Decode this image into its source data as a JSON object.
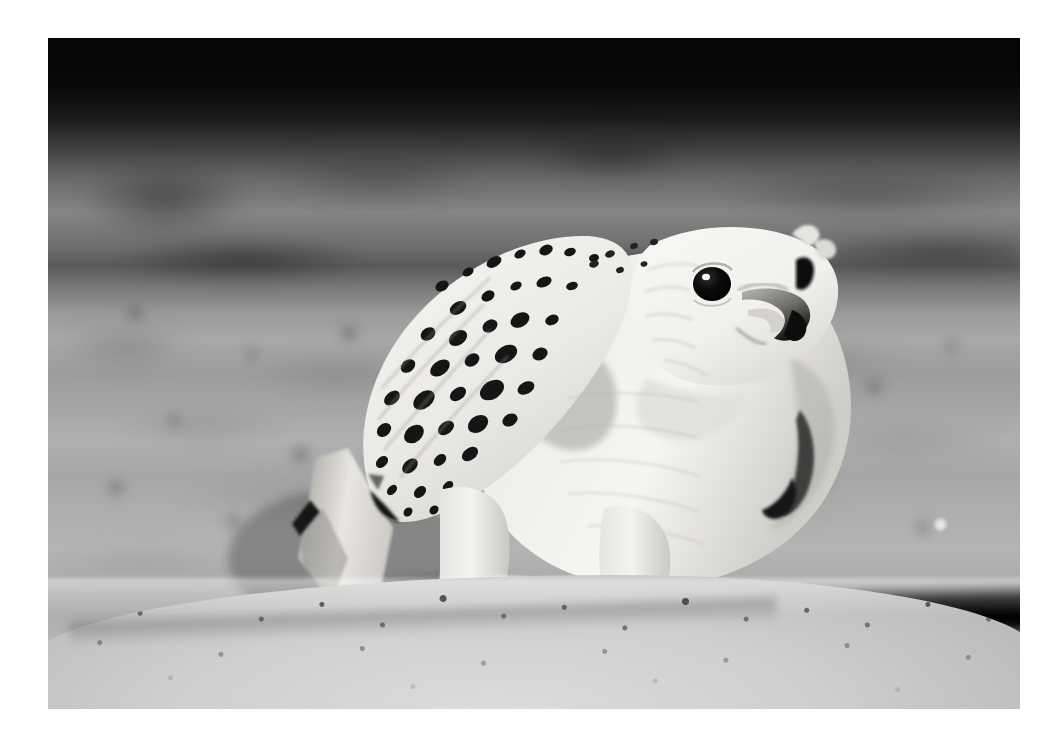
{
  "page": {
    "background_color": "#ffffff",
    "width": 1061,
    "height": 741
  },
  "photo": {
    "alt_text": "Gyrfalcon standing on sand",
    "subject": "white gyrfalcon",
    "orientation": "landscape",
    "color_mode": "black and white",
    "frame": {
      "left": 48,
      "top": 38,
      "width": 972,
      "height": 671
    },
    "tones": {
      "deep_black": "#050505",
      "shadow": "#1b1b1b",
      "midtone_dark": "#5a5a5a",
      "midtone": "#9a9a9a",
      "midtone_light": "#b4b4b4",
      "sand_light": "#dcdcdc",
      "plumage_white": "#f5f4f2",
      "plumage_shadow": "#c6c4c0",
      "beak_dark": "#1a1a1a",
      "eye_black": "#060606",
      "catchlight": "#ffffff"
    },
    "scene": {
      "background_description": "out-of-focus gravel ground with dark horizontal bands across the top",
      "foreground_description": "in-focus granular sand ridge across the bottom",
      "shadow_band_description": "dark shadow band behind the sand ridge on the right"
    },
    "bird_features": [
      "dark eye with catchlight",
      "hooked grey beak",
      "white head and breast",
      "black-spotted wing coverts",
      "folded wing with barred tips",
      "tail pointing down-left",
      "feathered legs",
      "dark talons gripping sand",
      "leather jess on left foot"
    ]
  }
}
